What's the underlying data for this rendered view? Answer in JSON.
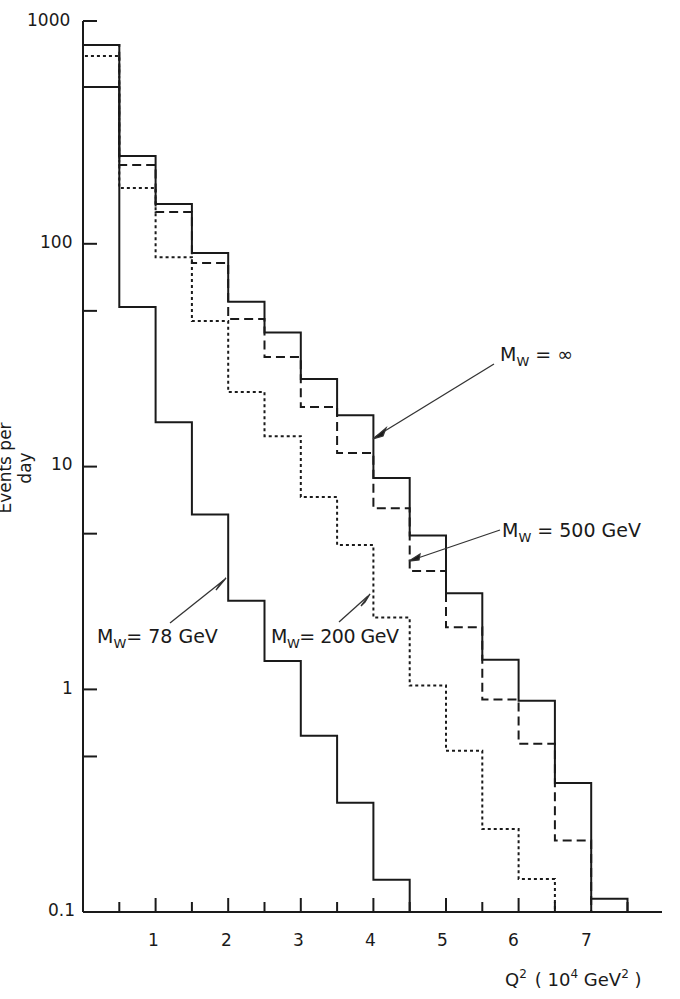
{
  "chart_data": {
    "type": "step-histogram",
    "title": "",
    "xlabel": "Q^2 (10^4 GeV^2)",
    "ylabel": "Events per day",
    "yscale": "log",
    "ylim": [
      0.1,
      1000
    ],
    "xlim": [
      0,
      8
    ],
    "x_ticks": [
      1,
      2,
      3,
      4,
      5,
      6,
      7
    ],
    "y_ticks": [
      "0.1",
      "1",
      "10",
      "100",
      "1000"
    ],
    "bin_width": 0.5,
    "bin_edges": [
      0,
      0.5,
      1,
      1.5,
      2,
      2.5,
      3,
      3.5,
      4,
      4.5,
      5,
      5.5,
      6,
      6.5,
      7,
      7.5
    ],
    "grid": false,
    "legend": "inline annotations with arrows",
    "series": [
      {
        "name": "M_W = ∞",
        "style": "solid",
        "values": [
          780,
          248,
          151,
          91,
          55,
          40,
          24.7,
          17,
          8.9,
          4.9,
          2.7,
          1.36,
          0.89,
          0.38,
          0.115
        ]
      },
      {
        "name": "M_W = 500 GeV",
        "style": "dashed",
        "values": [
          780,
          226,
          139,
          82,
          46,
          31,
          18.5,
          11.5,
          6.5,
          3.4,
          1.9,
          0.9,
          0.57,
          0.21
        ]
      },
      {
        "name": "M_W = 200 GeV",
        "style": "dotted",
        "values": [
          697,
          178,
          87,
          45,
          21.6,
          13.7,
          7.3,
          4.45,
          2.1,
          1.04,
          0.53,
          0.236,
          0.141
        ]
      },
      {
        "name": "M_W = 78 GeV",
        "style": "solid",
        "values": [
          506,
          52,
          15.8,
          6.1,
          2.5,
          1.34,
          0.62,
          0.31,
          0.14
        ]
      }
    ]
  },
  "labels": {
    "ylabel": "Events per day",
    "xlabel_main": "Q",
    "xlabel_sup": "2",
    "xlabel_unit_pre": "( 10",
    "xlabel_unit_sup1": "4",
    "xlabel_unit_mid": " GeV",
    "xlabel_unit_sup2": "2",
    "xlabel_unit_post": " )",
    "y_ticks": {
      "t1000": "1000",
      "t100": "100",
      "t10": "10",
      "t1": "1",
      "t01": "0.1"
    },
    "x_ticks": {
      "x1": "1",
      "x2": "2",
      "x3": "3",
      "x4": "4",
      "x5": "5",
      "x6": "6",
      "x7": "7"
    },
    "ann_inf_m": "M",
    "ann_inf_sub": "W",
    "ann_inf_val": " = ∞",
    "ann_500_m": "M",
    "ann_500_sub": "W",
    "ann_500_val": "  = 500 GeV",
    "ann_200_m": "M",
    "ann_200_sub": "W",
    "ann_200_val": "= 200 GeV",
    "ann_78_m": "M",
    "ann_78_sub": "W",
    "ann_78_val": "= 78 GeV"
  }
}
